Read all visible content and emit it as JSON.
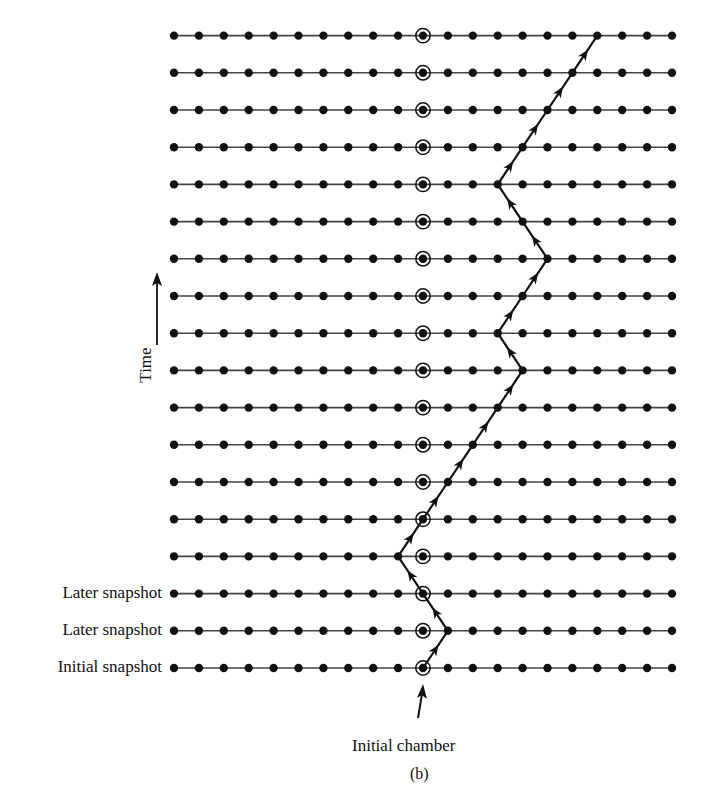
{
  "figure": {
    "caption": "(b)",
    "axis_label": "Time",
    "initial_chamber_label": "Initial chamber",
    "row_labels": [
      {
        "row": 0,
        "text": "Initial snapshot"
      },
      {
        "row": 1,
        "text": "Later snapshot"
      },
      {
        "row": 2,
        "text": "Later snapshot"
      }
    ],
    "grid": {
      "columns": 21,
      "rows": 18,
      "x0": 174,
      "dx": 24.9,
      "y_bottom": 668,
      "dy": 37.2,
      "initial_column": 10
    },
    "path_columns_by_row": [
      10,
      11,
      10,
      9,
      10,
      11,
      12,
      13,
      14,
      13,
      14,
      15,
      14,
      13,
      14,
      15,
      16,
      17
    ],
    "colors": {
      "ink": "#111111",
      "line": "#444444",
      "background": "#ffffff"
    }
  }
}
